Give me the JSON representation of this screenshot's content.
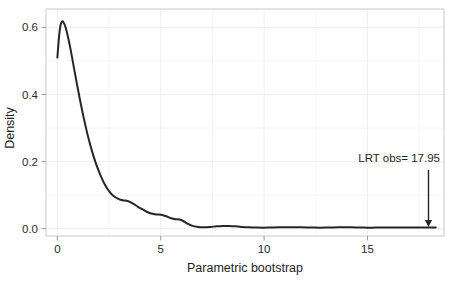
{
  "chart_data": {
    "type": "line",
    "title": "",
    "subtitle": "",
    "xlabel": "Parametric bootstrap",
    "ylabel": "Density",
    "xlim": [
      -0.55,
      18.7
    ],
    "ylim": [
      -0.022,
      0.655
    ],
    "xticks": [
      0,
      5,
      10,
      15
    ],
    "xtick_labels": [
      "0",
      "5",
      "10",
      "15"
    ],
    "yticks": [
      0.0,
      0.2,
      0.4,
      0.6
    ],
    "ytick_labels": [
      "0.0",
      "0.2",
      "0.4",
      "0.6"
    ],
    "grid": true,
    "grid_color": "#efefef",
    "legend": "none",
    "line_color": "#262626",
    "line_width": 2.0,
    "background": "#ffffff",
    "frame_color": "#c8c8c8",
    "series": [
      {
        "name": "Parametric bootstrap LRT density",
        "x": [
          0.0,
          0.08,
          0.15,
          0.22,
          0.3,
          0.4,
          0.52,
          0.65,
          0.8,
          0.95,
          1.1,
          1.25,
          1.4,
          1.55,
          1.7,
          1.85,
          2.0,
          2.15,
          2.3,
          2.45,
          2.6,
          2.75,
          2.9,
          3.05,
          3.2,
          3.35,
          3.5,
          3.7,
          3.9,
          4.1,
          4.3,
          4.5,
          4.7,
          4.9,
          5.1,
          5.3,
          5.5,
          5.7,
          5.9,
          6.1,
          6.3,
          6.5,
          6.8,
          7.1,
          7.4,
          7.7,
          8.0,
          8.3,
          8.6,
          8.9,
          9.3,
          9.7,
          10.2,
          10.7,
          11.2,
          11.8,
          12.4,
          13.0,
          13.6,
          14.2,
          14.8,
          15.4,
          16.0,
          16.6,
          17.2,
          17.8,
          18.3
        ],
        "y": [
          0.51,
          0.572,
          0.606,
          0.618,
          0.615,
          0.6,
          0.57,
          0.531,
          0.48,
          0.43,
          0.382,
          0.337,
          0.296,
          0.259,
          0.226,
          0.197,
          0.172,
          0.15,
          0.131,
          0.116,
          0.104,
          0.096,
          0.09,
          0.086,
          0.084,
          0.083,
          0.08,
          0.073,
          0.065,
          0.058,
          0.051,
          0.046,
          0.043,
          0.042,
          0.04,
          0.036,
          0.031,
          0.028,
          0.027,
          0.022,
          0.015,
          0.009,
          0.005,
          0.004,
          0.005,
          0.007,
          0.008,
          0.008,
          0.007,
          0.005,
          0.004,
          0.003,
          0.003,
          0.004,
          0.004,
          0.004,
          0.003,
          0.003,
          0.004,
          0.004,
          0.003,
          0.003,
          0.003,
          0.003,
          0.003,
          0.003,
          0.003
        ]
      }
    ],
    "annotations": [
      {
        "name": "lrt-observed",
        "label": "LRT obs= 17.95",
        "x": 17.95,
        "y_from": 0.175,
        "y_to": 0.006,
        "marker": "arrow-down",
        "color": "#262626"
      }
    ]
  }
}
